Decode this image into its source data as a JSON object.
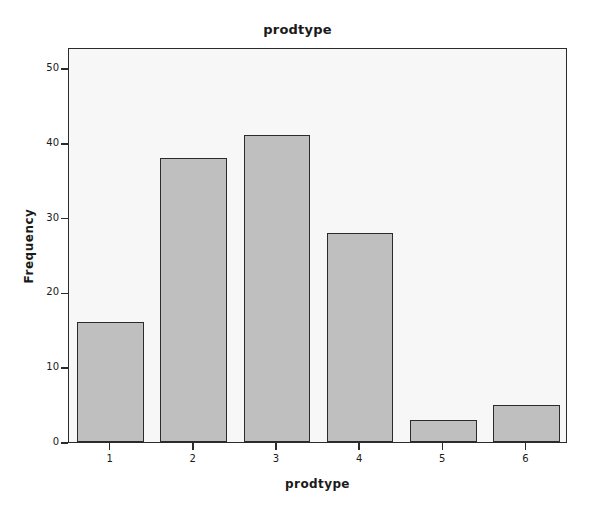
{
  "chart_data": {
    "type": "bar",
    "title": "prodtype",
    "xlabel": "prodtype",
    "ylabel": "Frequency",
    "categories": [
      "1",
      "2",
      "3",
      "4",
      "5",
      "6"
    ],
    "values": [
      16,
      38,
      41,
      28,
      3,
      5
    ],
    "ylim": [
      0,
      52.8
    ],
    "y_ticks": [
      0,
      10,
      20,
      30,
      40,
      50
    ],
    "y_tick_labels": [
      "0",
      "10",
      "20",
      "30",
      "40",
      "50"
    ],
    "grid": false,
    "legend": null,
    "bar_fill_color": "#bfbfbf",
    "bar_border_color": "#2b2b2b",
    "plot_background_color": "#f7f7f7",
    "figure_background_color": "#ffffff",
    "axis_color": "#2b2b2b",
    "text_color": "#1a1a1a"
  }
}
